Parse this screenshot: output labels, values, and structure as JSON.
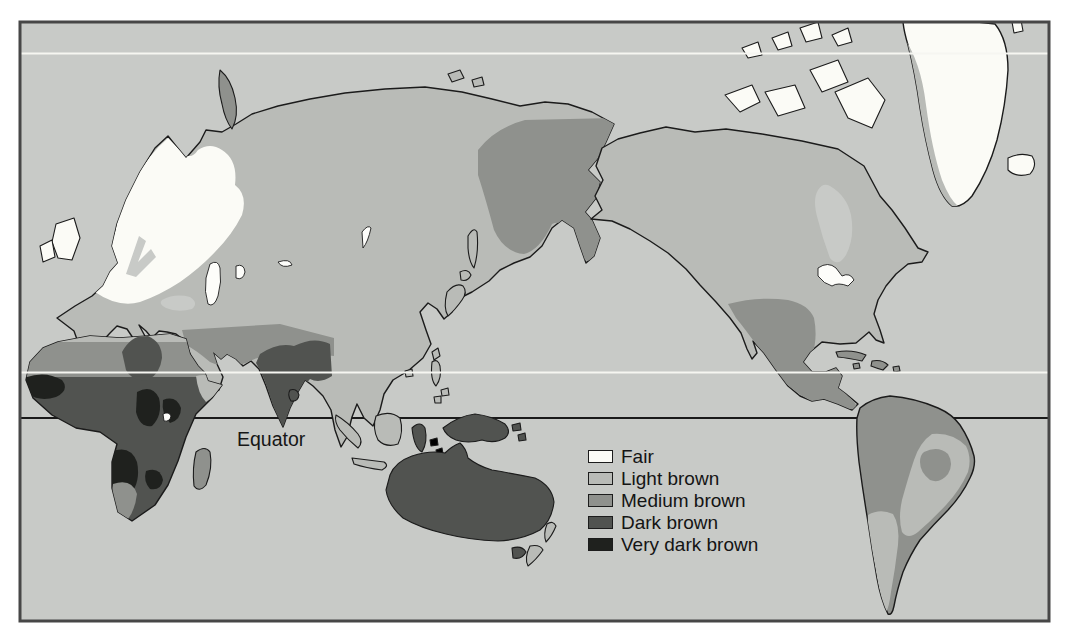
{
  "palette": {
    "page_bg": "#ffffff",
    "ocean": "#c8cac7",
    "fair": "#fbfbf6",
    "light_brown": "#b9bbb7",
    "medium_brown": "#8f918d",
    "dark_brown": "#515350",
    "very_dark_brown": "#1f211e",
    "lake": "#fdfdfa",
    "outline": "#1b1b1b",
    "frame": "#474747",
    "latitude_line": "#f6f6f1",
    "equator_line": "#1a1a1a"
  },
  "map": {
    "equator_label": "Equator",
    "regions": {
      "eurasia": {
        "category": "light_brown"
      },
      "europe_fair_zone": {
        "category": "fair"
      },
      "northeast_siberia": {
        "category": "medium_brown"
      },
      "middle_east_india_band": {
        "category": "medium_brown"
      },
      "india_dark_zone": {
        "category": "dark_brown"
      },
      "sri_lanka": {
        "category": "dark_brown"
      },
      "africa": {
        "category": "dark_brown"
      },
      "africa_mediterranean_coast": {
        "category": "light_brown"
      },
      "sahara_sahel_band": {
        "category": "medium_brown"
      },
      "central_sahara_dark_patch": {
        "category": "dark_brown"
      },
      "horn_of_africa": {
        "category": "light_brown"
      },
      "west_africa_very_dark": {
        "category": "very_dark_brown"
      },
      "congo_very_dark": {
        "category": "very_dark_brown"
      },
      "east_africa_very_dark": {
        "category": "very_dark_brown"
      },
      "southern_africa_very_dark": {
        "category": "very_dark_brown"
      },
      "southwest_africa_medium": {
        "category": "medium_brown"
      },
      "madagascar": {
        "category": "medium_brown"
      },
      "britain": {
        "category": "fair"
      },
      "ireland": {
        "category": "fair"
      },
      "iceland": {
        "category": "fair"
      },
      "svalbard": {
        "category": "fair"
      },
      "novaya_zemlya": {
        "category": "medium_brown"
      },
      "new_siberian_islands": {
        "category": "light_brown"
      },
      "japan": {
        "category": "light_brown"
      },
      "sakhalin": {
        "category": "light_brown"
      },
      "taiwan": {
        "category": "light_brown"
      },
      "hainan": {
        "category": "light_brown"
      },
      "philippines": {
        "category": "light_brown"
      },
      "indonesia_west": {
        "category": "light_brown"
      },
      "sulawesi": {
        "category": "dark_brown"
      },
      "new_guinea": {
        "category": "dark_brown"
      },
      "melanesia_islands": {
        "category": "dark_brown"
      },
      "australia": {
        "category": "dark_brown"
      },
      "tasmania": {
        "category": "dark_brown"
      },
      "new_zealand": {
        "category": "light_brown"
      },
      "north_america": {
        "category": "light_brown"
      },
      "canadian_arctic_islands": {
        "category": "fair"
      },
      "greenland": {
        "category": "fair"
      },
      "greenland_west_coast": {
        "category": "light_brown"
      },
      "southwest_north_america_medium": {
        "category": "medium_brown"
      },
      "caribbean_islands": {
        "category": "medium_brown"
      },
      "south_america": {
        "category": "medium_brown"
      },
      "eastern_brazil_light": {
        "category": "light_brown"
      },
      "brazil_interior_medium": {
        "category": "medium_brown"
      },
      "southern_cone_light": {
        "category": "light_brown"
      },
      "lakes": {
        "category": "lake"
      },
      "black_sea": {
        "category": "ocean"
      },
      "baltic_sea": {
        "category": "ocean"
      },
      "hudson_bay": {
        "category": "ocean"
      }
    }
  },
  "legend": {
    "items": [
      {
        "label": "Fair",
        "category": "fair"
      },
      {
        "label": "Light brown",
        "category": "light_brown"
      },
      {
        "label": "Medium brown",
        "category": "medium_brown"
      },
      {
        "label": "Dark brown",
        "category": "dark_brown"
      },
      {
        "label": "Very dark brown",
        "category": "very_dark_brown"
      }
    ]
  }
}
